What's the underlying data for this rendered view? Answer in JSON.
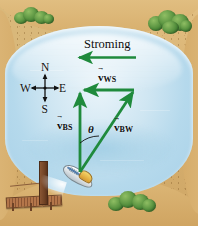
{
  "figure": {
    "scene": {
      "water_label": "river",
      "shore_label": "sandy bank",
      "dock_label": "wooden pier",
      "boat_label": "motor boat"
    },
    "current": {
      "label": "Stroming",
      "arrow_direction": "west",
      "arrow_color": "#1f8a3c"
    },
    "compass": {
      "north": "N",
      "east": "E",
      "south": "S",
      "west": "W"
    },
    "vectors": [
      {
        "id": "vbs",
        "symbol": "v",
        "subscript": "BS",
        "description": "boat relative to shore",
        "direction": "north",
        "color": "#1f8a3c"
      },
      {
        "id": "vws",
        "symbol": "v",
        "subscript": "WS",
        "description": "water relative to shore",
        "direction": "west",
        "color": "#1f8a3c"
      },
      {
        "id": "vbw",
        "symbol": "v",
        "subscript": "BW",
        "description": "boat relative to water",
        "direction": "northeast",
        "color": "#1f8a3c"
      }
    ],
    "angle": {
      "symbol": "θ",
      "between": "vbs-vbw"
    },
    "colors": {
      "vector_green": "#1f8a3c",
      "water_light": "#cfe6f2",
      "water_deep": "#a8d1e8",
      "sand": "#d8b171",
      "foliage": "#4f8b3a",
      "dock_wood": "#8c5634",
      "background": "#ffffff"
    }
  }
}
